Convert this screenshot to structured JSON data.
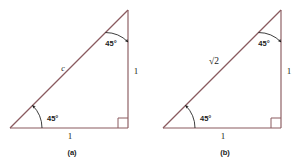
{
  "figure": {
    "background_color": "#ffffff",
    "line_color": "#8a5a5f",
    "text_color": "#1a1a1a",
    "panels": [
      {
        "id": "a",
        "caption": "(a)",
        "base_label": "1",
        "vertical_label": "1",
        "hypotenuse_label": "c",
        "angle_bottom_left": "45°",
        "angle_top_right": "45°",
        "right_angle_marker": "right-angle-square",
        "geometry": {
          "bottom_left": [
            10,
            128
          ],
          "bottom_right": [
            128,
            128
          ],
          "apex": [
            128,
            10
          ]
        }
      },
      {
        "id": "b",
        "caption": "(b)",
        "base_label": "1",
        "vertical_label": "1",
        "hypotenuse_label": "√2",
        "hypotenuse_radicand": "2",
        "angle_bottom_left": "45°",
        "angle_top_right": "45°",
        "right_angle_marker": "right-angle-square",
        "geometry": {
          "bottom_left": [
            163,
            128
          ],
          "bottom_right": [
            281,
            128
          ],
          "apex": [
            281,
            10
          ]
        }
      }
    ]
  }
}
